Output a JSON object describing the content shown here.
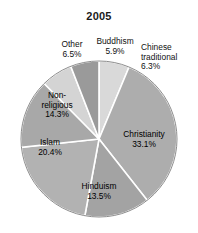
{
  "chart_data": {
    "type": "pie",
    "title": "2005",
    "xlabel": "",
    "ylabel": "",
    "legend_position": "none",
    "grid": false,
    "unit": "%",
    "labels_inside": [
      "Christianity",
      "Hinduism",
      "Islam",
      "Non-religious"
    ],
    "labels_outside": [
      "Other",
      "Buddhism",
      "Chinese traditional"
    ],
    "start_angle_deg": 0,
    "direction": "clockwise",
    "categories": [
      "Chinese traditional",
      "Christianity",
      "Hinduism",
      "Islam",
      "Non-religious",
      "Other",
      "Buddhism"
    ],
    "values": [
      6.3,
      33.1,
      13.5,
      20.4,
      14.3,
      6.5,
      5.9
    ],
    "slices": [
      {
        "name": "Chinese traditional",
        "label": "Chinese\ntraditional",
        "label_line1": "Chinese",
        "label_line2": "traditional",
        "value": 6.3,
        "value_text": "6.3%",
        "color": "#d9d9d9"
      },
      {
        "name": "Christianity",
        "label": "Christianity",
        "value": 33.1,
        "value_text": "33.1%",
        "color": "#adadad"
      },
      {
        "name": "Hinduism",
        "label": "Hinduism",
        "value": 13.5,
        "value_text": "13.5%",
        "color": "#a3a3a3"
      },
      {
        "name": "Islam",
        "label": "Islam",
        "value": 20.4,
        "value_text": "20.4%",
        "color": "#b2b2b2"
      },
      {
        "name": "Non-religious",
        "label": "Non-religious",
        "label_line1": "Non-",
        "label_line2": "religious",
        "value": 14.3,
        "value_text": "14.3%",
        "color": "#a8a8a8"
      },
      {
        "name": "Other",
        "label": "Other",
        "value": 6.5,
        "value_text": "6.5%",
        "color": "#d4d4d4"
      },
      {
        "name": "Buddhism",
        "label": "Buddhism",
        "value": 5.9,
        "value_text": "5.9%",
        "color": "#9a9a9a"
      }
    ]
  },
  "style": {
    "background": "#ffffff",
    "separator_color": "#ffffff",
    "outline_color": "#8c8c8c",
    "text_color": "#000000"
  }
}
